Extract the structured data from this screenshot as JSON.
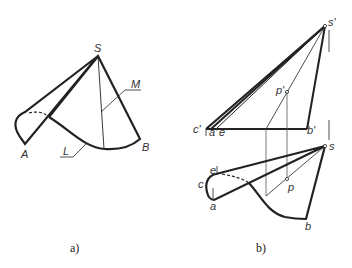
{
  "figure_a": {
    "caption": "a)",
    "labels": {
      "apex": "S",
      "point_a": "A",
      "point_b": "B",
      "line_l": "L",
      "line_m": "M"
    }
  },
  "figure_b": {
    "caption": "b)",
    "front_view_labels": {
      "apex": "s'",
      "c": "c'",
      "a": "a'",
      "e": "e'",
      "b": "b'",
      "p": "p'"
    },
    "top_view_labels": {
      "apex": "s",
      "e": "e",
      "c": "c",
      "a": "a",
      "p": "p",
      "b": "b"
    }
  },
  "colors": {
    "stroke": "#222222",
    "thin": "#555555",
    "background": "#ffffff"
  }
}
